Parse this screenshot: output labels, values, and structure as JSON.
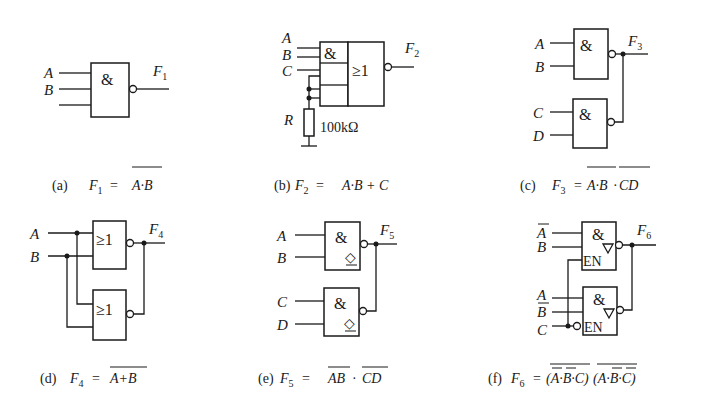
{
  "figure": {
    "panels": [
      {
        "id": "a",
        "caption_tag": "(a)",
        "output": "F",
        "output_sub": "1",
        "inputs": [
          "A",
          "B"
        ],
        "gate_symbol": "&",
        "expression": "A·B",
        "expression_full": "F1 = NOT(A·B)"
      },
      {
        "id": "b",
        "caption_tag": "(b)",
        "output": "F",
        "output_sub": "2",
        "inputs": [
          "A",
          "B",
          "C"
        ],
        "gate_symbol_and": "&",
        "gate_symbol_or": "≥1",
        "resistor_label": "R",
        "resistor_value": "100kΩ",
        "expression": "A·B + C",
        "expression_full": "F2 = A·B + C"
      },
      {
        "id": "c",
        "caption_tag": "(c)",
        "output": "F",
        "output_sub": "3",
        "inputs": [
          "A",
          "B",
          "C",
          "D"
        ],
        "gate_symbol": "&",
        "expr_part1": "A·B",
        "expr_sep": "·",
        "expr_part2": "CD",
        "expression_full": "F3 = NOT(A·B)·NOT(CD)"
      },
      {
        "id": "d",
        "caption_tag": "(d)",
        "output": "F",
        "output_sub": "4",
        "inputs": [
          "A",
          "B"
        ],
        "gate_symbol": "≥1",
        "expression": "A+B",
        "expression_full": "F4 = NOT(A+B)"
      },
      {
        "id": "e",
        "caption_tag": "(e)",
        "output": "F",
        "output_sub": "5",
        "inputs": [
          "A",
          "B",
          "C",
          "D"
        ],
        "gate_symbol": "&",
        "od_symbol": "◇",
        "expr_part1": "AB",
        "expr_sep": "·",
        "expr_part2": "CD",
        "expression_full": "F5 = NOT(AB)·NOT(CD)"
      },
      {
        "id": "f",
        "caption_tag": "(f)",
        "output": "F",
        "output_sub": "6",
        "inputs_top": [
          "A",
          "B"
        ],
        "inputs_bottom": [
          "A",
          "B",
          "C"
        ],
        "gate_symbol": "&",
        "enable_label": "EN",
        "expr_part1": "(A·B·C)",
        "expr_part2": "(A·B·C)",
        "expression_full": "F6 = NOT(NOT A·NOT B·C)·NOT(A·NOT B·NOT C)"
      }
    ],
    "equals": "="
  }
}
